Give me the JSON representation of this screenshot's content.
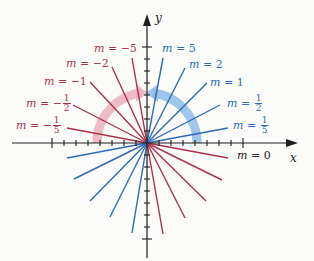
{
  "diagram": {
    "title": "",
    "axes": {
      "x_label": "x",
      "y_label": "y"
    },
    "colors": {
      "negative_slope": "#a8344a",
      "positive_slope": "#2f6bb4",
      "arc_negative": "#e8a7b4",
      "arc_positive": "#8ab6e4",
      "axis": "#1e1e1e"
    },
    "labels": {
      "m_neg5": {
        "prefix": "m = ",
        "value": "−5"
      },
      "m_neg2": {
        "prefix": "m = ",
        "value": "−2"
      },
      "m_neg1": {
        "prefix": "m = ",
        "value": "−1"
      },
      "m_neg_half": {
        "prefix": "m = −",
        "num": "1",
        "den": "2"
      },
      "m_neg_fifth": {
        "prefix": "m = −",
        "num": "1",
        "den": "5"
      },
      "m_pos5": {
        "prefix": "m = ",
        "value": "5"
      },
      "m_pos2": {
        "prefix": "m = ",
        "value": "2"
      },
      "m_pos1": {
        "prefix": "m = ",
        "value": "1"
      },
      "m_pos_half": {
        "prefix": "m = ",
        "num": "1",
        "den": "2"
      },
      "m_pos_fifth": {
        "prefix": "m = ",
        "num": "1",
        "den": "5"
      },
      "m_zero": {
        "prefix": "m = ",
        "value": "0"
      }
    },
    "slopes": [
      "-5",
      "-2",
      "-1",
      "-1/2",
      "-1/5",
      "0",
      "1/5",
      "1/2",
      "1",
      "2",
      "5"
    ]
  }
}
